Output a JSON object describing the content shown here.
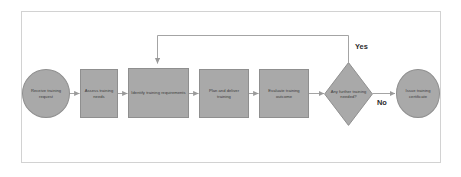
{
  "diagram": {
    "frame": {
      "border_color": "#d2d2d2",
      "background": "#ffffff"
    },
    "style": {
      "node_fill": "#a9a9a9",
      "node_border": "#8f8f8f",
      "node_text_color": "#3a3a3a",
      "connector_color": "#9a9a9a",
      "label_color": "#2b2b2b"
    },
    "nodes": [
      {
        "id": "receive",
        "shape": "terminator",
        "label": "Receive training request"
      },
      {
        "id": "assess",
        "shape": "process",
        "label": "Assess training needs"
      },
      {
        "id": "identify",
        "shape": "process",
        "label": "Identify training requirements"
      },
      {
        "id": "deliver",
        "shape": "process",
        "label": "Plan and deliver training"
      },
      {
        "id": "evaluate",
        "shape": "process",
        "label": "Evaluate training outcome"
      },
      {
        "id": "decision",
        "shape": "decision",
        "label": "Any further training needed?"
      },
      {
        "id": "issue",
        "shape": "terminator",
        "label": "Issue training certificate"
      }
    ],
    "edge_labels": [
      {
        "id": "yes",
        "text": "Yes"
      },
      {
        "id": "no",
        "text": "No"
      }
    ]
  }
}
